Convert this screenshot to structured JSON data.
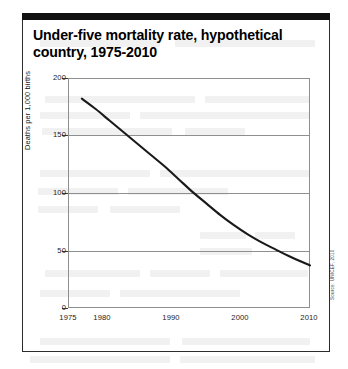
{
  "figure": {
    "title": "Under-five mortality rate, hypothetical country, 1975-2010",
    "title_line1": "Under-five mortality rate, hypothetical",
    "title_line2": "country, 1975-2010",
    "source_note": "Source: UNICEF, 2010",
    "frame_color": "#2b2b2b",
    "rule_color": "#111111"
  },
  "chart_data": {
    "type": "line",
    "title": "Under-five mortality rate, hypothetical country, 1975-2010",
    "subtitle": "",
    "xlabel": "",
    "ylabel": "Deaths per 1,000 births",
    "xlim": [
      1975,
      2010
    ],
    "ylim": [
      0,
      200
    ],
    "xticks": [
      1975,
      1980,
      1990,
      2000,
      2010
    ],
    "xtick_labels": [
      "1975",
      "1980",
      "1990",
      "2000",
      "2010"
    ],
    "yticks": [
      0,
      50,
      100,
      150,
      200
    ],
    "ytick_labels": [
      "0",
      "50",
      "100",
      "150",
      "200"
    ],
    "grid": "horizontal",
    "gridlines_at": [
      50,
      100,
      150
    ],
    "legend": "none",
    "series": [
      {
        "name": "Under-five mortality rate",
        "color": "#1a1a1a",
        "line_width": 2.1,
        "x": [
          1977,
          1979,
          1981,
          1983,
          1985,
          1987,
          1989,
          1991,
          1993,
          1995,
          1997,
          1999,
          2001,
          2003,
          2005,
          2007,
          2010
        ],
        "values": [
          182,
          173,
          163,
          153,
          143,
          133,
          123,
          112,
          101,
          91,
          81,
          72,
          64,
          57,
          51,
          45,
          37
        ]
      }
    ],
    "annotations": []
  }
}
